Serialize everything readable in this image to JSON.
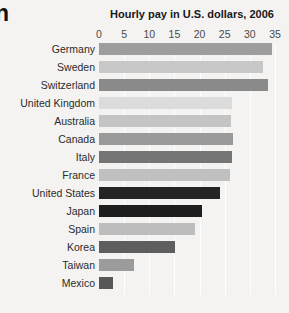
{
  "edge_fragment": "n",
  "chart_data": {
    "type": "bar",
    "orientation": "horizontal",
    "title": "Hourly pay in U.S. dollars, 2006",
    "xlabel": "",
    "ylabel": "",
    "xlim": [
      0,
      35
    ],
    "xticks": [
      0,
      5,
      10,
      15,
      20,
      25,
      30,
      35
    ],
    "xtick_labels": [
      "0",
      "5",
      "10",
      "15",
      "20",
      "25",
      "30",
      "35"
    ],
    "grid": true,
    "grid_axis": "x",
    "legend": "none",
    "background_color": "#f4f3f1",
    "categories": [
      "Germany",
      "Sweden",
      "Switzerland",
      "United Kingdom",
      "Australia",
      "Canada",
      "Italy",
      "France",
      "United States",
      "Japan",
      "Spain",
      "Korea",
      "Taiwan",
      "Mexico"
    ],
    "values": [
      34.4,
      32.6,
      33.6,
      26.5,
      26.3,
      26.7,
      26.4,
      26.0,
      24.0,
      20.5,
      19.1,
      15.1,
      7.0,
      2.8
    ],
    "bar_colors": [
      "#9d9d9d",
      "#c8c8c8",
      "#8a8a8a",
      "#dcdcdc",
      "#c4c4c4",
      "#9a9a9a",
      "#757575",
      "#c0c0c0",
      "#242424",
      "#1e1e1e",
      "#bdbdbd",
      "#5e5e5e",
      "#9b9b9b",
      "#575757"
    ]
  }
}
